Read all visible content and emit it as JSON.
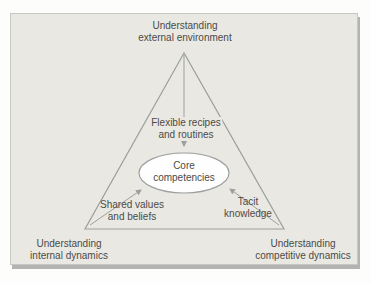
{
  "figure": {
    "type": "triangle-core-competencies-diagram",
    "colors": {
      "page_background": "#fdfdfc",
      "panel_background": "#eae8e2",
      "panel_border": "#c7c7c3",
      "panel_shadow": "#b3b3b1",
      "line_color": "#9ba09d",
      "ellipse_fill": "#fefefe",
      "text_color": "#4b4b49"
    },
    "nodes": {
      "external": {
        "line1": "Understanding",
        "line2": "external environment"
      },
      "internal": {
        "line1": "Understanding",
        "line2": "internal dynamics"
      },
      "competitive": {
        "line1": "Understanding",
        "line2": "competitive dynamics"
      },
      "flexible": {
        "line1": "Flexible recipes",
        "line2": "and routines"
      },
      "core": {
        "line1": "Core",
        "line2": "competencies"
      },
      "shared": {
        "line1": "Shared values",
        "line2": "and beliefs"
      },
      "tacit": {
        "line1": "Tacit",
        "line2": "knowledge"
      }
    },
    "relations": [
      {
        "from": "external-environment-apex",
        "to": "core-competencies",
        "via": "flexible-recipes-and-routines"
      },
      {
        "from": "internal-dynamics-vertex",
        "to": "core-competencies",
        "via": "shared-values-and-beliefs"
      },
      {
        "from": "competitive-dynamics-vertex",
        "to": "core-competencies",
        "via": "tacit-knowledge"
      }
    ]
  }
}
